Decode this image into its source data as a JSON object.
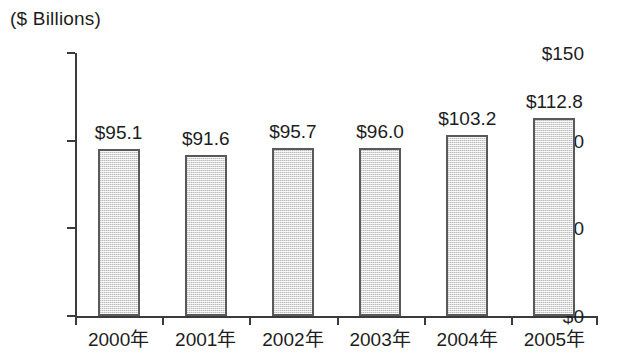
{
  "chart_data": {
    "type": "bar",
    "title": "",
    "unit_caption": "($ Billions)",
    "xlabel": "",
    "ylabel": "",
    "categories": [
      "2000年",
      "2001年",
      "2002年",
      "2003年",
      "2004年",
      "2005年"
    ],
    "values": [
      95.1,
      91.6,
      95.7,
      96.0,
      103.2,
      112.8
    ],
    "data_labels": [
      "$95.1",
      "$91.6",
      "$95.7",
      "$96.0",
      "$103.2",
      "$112.8"
    ],
    "ylim": [
      0,
      150
    ],
    "yticks": [
      0,
      50,
      100,
      150
    ],
    "ytick_labels": [
      "$0",
      "$50",
      "$100",
      "$150"
    ],
    "grid": false,
    "legend": false,
    "bar_fill_color": "#dcdcdc",
    "bar_border_color": "#595959",
    "axis_color": "#3b3b3b",
    "text_color": "#1d1d1d"
  }
}
